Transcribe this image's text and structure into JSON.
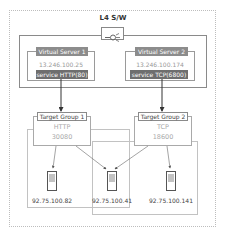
{
  "title": "L4 S/W",
  "switch_icon": "network-switch-icon",
  "virtual_servers": [
    {
      "label": "Virtual Server 1",
      "ip": "13.246.100.25",
      "service": "service HTTP(80)"
    },
    {
      "label": "Virtual Server 2",
      "ip": "13.246.100.174",
      "service": "service TCP(6800)"
    }
  ],
  "target_groups": [
    {
      "label": "Target Group 1",
      "protocol": "HTTP",
      "port": "30080"
    },
    {
      "label": "Target Group 2",
      "protocol": "TCP",
      "port": "18600"
    }
  ],
  "servers": [
    {
      "ip": "92.75.100.82",
      "icon": "server-icon"
    },
    {
      "ip": "92.75.100.41",
      "icon": "server-icon"
    },
    {
      "ip": "92.75.100.141",
      "icon": "server-icon"
    }
  ],
  "colors": {
    "label_bg": "#8c8c8c",
    "service_bg": "#6e6e6e",
    "border": "#8a8a8a",
    "arrow": "#333333"
  }
}
